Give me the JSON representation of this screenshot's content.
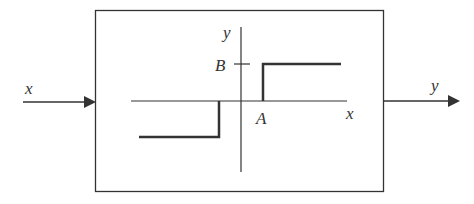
{
  "diagram": {
    "type": "block-diagram",
    "input_label": "x",
    "output_label": "y",
    "block": {
      "characteristic": {
        "x_axis_label": "x",
        "y_axis_label": "y",
        "level_label": "B",
        "threshold_label": "A"
      }
    }
  },
  "colors": {
    "line": "#333333",
    "background": "#ffffff"
  }
}
